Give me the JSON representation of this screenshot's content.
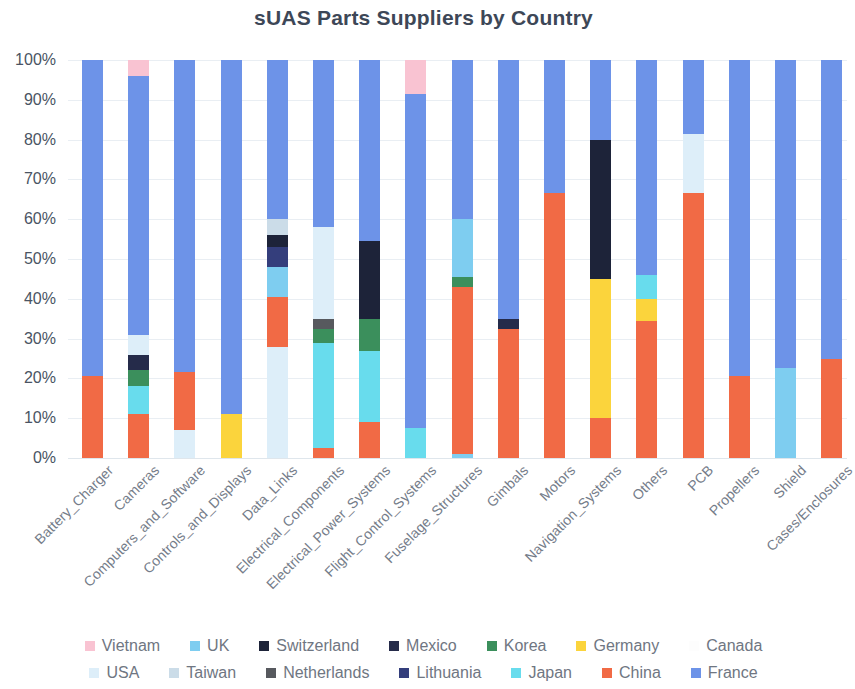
{
  "chart_data": {
    "type": "bar",
    "subtype": "stacked-100-percent",
    "title": "sUAS Parts Suppliers by Country",
    "xlabel": "",
    "ylabel": "",
    "ylim": [
      0,
      100
    ],
    "ytick_labels": [
      "0%",
      "10%",
      "20%",
      "30%",
      "40%",
      "50%",
      "60%",
      "70%",
      "80%",
      "90%",
      "100%"
    ],
    "ytick_values": [
      0,
      10,
      20,
      30,
      40,
      50,
      60,
      70,
      80,
      90,
      100
    ],
    "grid": true,
    "legend_position": "bottom",
    "categories": [
      "Battery_Charger",
      "Cameras",
      "Computers_and_Software",
      "Controls_and_Displays",
      "Data_Links",
      "Electrical_Components",
      "Electrical_Power_Systems",
      "Flight_Control_Systems",
      "Fuselage_Structures",
      "Gimbals",
      "Motors",
      "Navigation_Systems",
      "Others",
      "PCB",
      "Propellers",
      "Shield",
      "Cases/Enclosures"
    ],
    "series": [
      {
        "name": "Vietnam",
        "color": "#f9c3d2",
        "values": [
          0,
          4,
          0,
          0,
          0,
          0,
          0,
          8.5,
          0,
          0,
          0,
          0,
          0,
          0,
          0,
          0,
          0
        ]
      },
      {
        "name": "UK",
        "color": "#7ecdf0",
        "values": [
          0,
          0,
          0,
          0,
          7.5,
          0,
          0,
          0,
          15.5,
          0,
          0,
          0,
          0,
          0,
          0,
          22.5,
          0
        ]
      },
      {
        "name": "Switzerland",
        "color": "#1d2339",
        "values": [
          0,
          0,
          0,
          0,
          3,
          0,
          19.5,
          0,
          0,
          0,
          0,
          35,
          0,
          0,
          0,
          0,
          0
        ]
      },
      {
        "name": "Mexico",
        "color": "#252b4a",
        "values": [
          0,
          4,
          0,
          0,
          0,
          0,
          0,
          0,
          0,
          2.5,
          0,
          0,
          0,
          0,
          0,
          0,
          0
        ]
      },
      {
        "name": "Korea",
        "color": "#3b8f5c",
        "values": [
          0,
          4,
          0,
          0,
          0,
          3.5,
          8,
          0,
          2.5,
          0,
          0,
          0,
          0,
          0,
          0,
          0,
          0
        ]
      },
      {
        "name": "Germany",
        "color": "#fbd43c",
        "values": [
          0,
          0,
          0,
          11,
          0,
          0,
          0,
          0,
          0,
          0,
          0,
          35,
          5.5,
          0,
          0,
          0,
          0
        ]
      },
      {
        "name": "Canada",
        "color": "#fdfdfd",
        "values": [
          0,
          0,
          0,
          0,
          0,
          0,
          0,
          0,
          0,
          0,
          0,
          0,
          0,
          0,
          0,
          0,
          0
        ]
      },
      {
        "name": "USA",
        "color": "#ddeef9",
        "values": [
          0,
          5,
          7,
          0,
          28,
          23,
          0,
          0,
          0,
          0,
          0,
          0,
          0,
          15,
          0,
          0,
          0
        ]
      },
      {
        "name": "Taiwan",
        "color": "#cbdce8",
        "values": [
          0,
          0,
          0,
          0,
          4,
          0,
          0,
          0,
          0,
          0,
          0,
          0,
          0,
          0,
          0,
          0,
          0
        ]
      },
      {
        "name": "Netherlands",
        "color": "#57595e",
        "values": [
          0,
          0,
          0,
          0,
          0,
          2.5,
          0,
          0,
          0,
          0,
          0,
          0,
          0,
          0,
          0,
          0,
          0
        ]
      },
      {
        "name": "Lithuania",
        "color": "#343e7c",
        "values": [
          0,
          0,
          0,
          0,
          5,
          0,
          0,
          0,
          0,
          0,
          0,
          0,
          0,
          0,
          0,
          0,
          0
        ]
      },
      {
        "name": "Japan",
        "color": "#68dced",
        "values": [
          0,
          7,
          0,
          0,
          0,
          26.5,
          18,
          7.5,
          0,
          0,
          0,
          0,
          6,
          0,
          0,
          0,
          0
        ]
      },
      {
        "name": "China",
        "color": "#f16a45",
        "values": [
          20.5,
          11,
          14.5,
          0,
          12.5,
          2.5,
          9,
          0,
          42,
          32.5,
          66.5,
          10,
          34.5,
          66.5,
          20.5,
          0,
          25
        ]
      },
      {
        "name": "France",
        "color": "#6d93e8",
        "values": [
          79.5,
          65,
          78.5,
          89,
          40,
          42,
          45.5,
          84,
          40,
          65,
          33.5,
          20,
          54,
          18.5,
          79.5,
          77.5,
          75
        ]
      }
    ],
    "stack_order_bottom_to_top": [
      "China",
      "Japan",
      "Korea",
      "Netherlands",
      "Lithuania",
      "Switzerland",
      "Mexico",
      "Germany",
      "Taiwan",
      "USA",
      "UK",
      "Canada",
      "France",
      "Vietnam"
    ],
    "bar_stacks": [
      {
        "category": "Battery_Charger",
        "segments": [
          {
            "name": "China",
            "from": 0,
            "to": 20.5
          },
          {
            "name": "France",
            "from": 20.5,
            "to": 100
          }
        ]
      },
      {
        "category": "Cameras",
        "segments": [
          {
            "name": "China",
            "from": 0,
            "to": 11
          },
          {
            "name": "Japan",
            "from": 11,
            "to": 18
          },
          {
            "name": "Korea",
            "from": 18,
            "to": 22
          },
          {
            "name": "Mexico",
            "from": 22,
            "to": 26
          },
          {
            "name": "USA",
            "from": 26,
            "to": 31
          },
          {
            "name": "France",
            "from": 31,
            "to": 96
          },
          {
            "name": "Vietnam",
            "from": 96,
            "to": 100
          }
        ]
      },
      {
        "category": "Computers_and_Software",
        "segments": [
          {
            "name": "USA",
            "from": 0,
            "to": 7
          },
          {
            "name": "China",
            "from": 7,
            "to": 21.5
          },
          {
            "name": "France",
            "from": 21.5,
            "to": 100
          }
        ]
      },
      {
        "category": "Controls_and_Displays",
        "segments": [
          {
            "name": "Germany",
            "from": 0,
            "to": 11
          },
          {
            "name": "France",
            "from": 11,
            "to": 100
          }
        ]
      },
      {
        "category": "Data_Links",
        "segments": [
          {
            "name": "USA",
            "from": 0,
            "to": 28
          },
          {
            "name": "China",
            "from": 28,
            "to": 40.5
          },
          {
            "name": "UK",
            "from": 40.5,
            "to": 48
          },
          {
            "name": "Lithuania",
            "from": 48,
            "to": 53
          },
          {
            "name": "Switzerland",
            "from": 53,
            "to": 56
          },
          {
            "name": "Taiwan",
            "from": 56,
            "to": 60
          },
          {
            "name": "France",
            "from": 60,
            "to": 100
          }
        ]
      },
      {
        "category": "Electrical_Components",
        "segments": [
          {
            "name": "China",
            "from": 0,
            "to": 2.5
          },
          {
            "name": "Japan",
            "from": 2.5,
            "to": 29
          },
          {
            "name": "Korea",
            "from": 29,
            "to": 32.5
          },
          {
            "name": "Netherlands",
            "from": 32.5,
            "to": 35
          },
          {
            "name": "USA",
            "from": 35,
            "to": 58
          },
          {
            "name": "France",
            "from": 58,
            "to": 100
          }
        ]
      },
      {
        "category": "Electrical_Power_Systems",
        "segments": [
          {
            "name": "China",
            "from": 0,
            "to": 9
          },
          {
            "name": "Japan",
            "from": 9,
            "to": 27
          },
          {
            "name": "Korea",
            "from": 27,
            "to": 35
          },
          {
            "name": "Switzerland",
            "from": 35,
            "to": 54.5
          },
          {
            "name": "France",
            "from": 54.5,
            "to": 100
          }
        ]
      },
      {
        "category": "Flight_Control_Systems",
        "segments": [
          {
            "name": "Japan",
            "from": 0,
            "to": 7.5
          },
          {
            "name": "France",
            "from": 7.5,
            "to": 91.5
          },
          {
            "name": "Vietnam",
            "from": 91.5,
            "to": 100
          }
        ]
      },
      {
        "category": "Fuselage_Structures",
        "segments": [
          {
            "name": "UK",
            "from": 0,
            "to": 1
          },
          {
            "name": "China",
            "from": 1,
            "to": 43
          },
          {
            "name": "Korea",
            "from": 43,
            "to": 45.5
          },
          {
            "name": "UK",
            "from": 45.5,
            "to": 60
          },
          {
            "name": "France",
            "from": 60,
            "to": 100
          }
        ]
      },
      {
        "category": "Gimbals",
        "segments": [
          {
            "name": "China",
            "from": 0,
            "to": 32.5
          },
          {
            "name": "Mexico",
            "from": 32.5,
            "to": 35
          },
          {
            "name": "France",
            "from": 35,
            "to": 100
          }
        ]
      },
      {
        "category": "Motors",
        "segments": [
          {
            "name": "China",
            "from": 0,
            "to": 66.5
          },
          {
            "name": "France",
            "from": 66.5,
            "to": 100
          }
        ]
      },
      {
        "category": "Navigation_Systems",
        "segments": [
          {
            "name": "China",
            "from": 0,
            "to": 10
          },
          {
            "name": "Germany",
            "from": 10,
            "to": 45
          },
          {
            "name": "Switzerland",
            "from": 45,
            "to": 80
          },
          {
            "name": "France",
            "from": 80,
            "to": 100
          }
        ]
      },
      {
        "category": "Others",
        "segments": [
          {
            "name": "China",
            "from": 0,
            "to": 34.5
          },
          {
            "name": "Germany",
            "from": 34.5,
            "to": 40
          },
          {
            "name": "Japan",
            "from": 40,
            "to": 46
          },
          {
            "name": "France",
            "from": 46,
            "to": 100
          }
        ]
      },
      {
        "category": "PCB",
        "segments": [
          {
            "name": "China",
            "from": 0,
            "to": 66.5
          },
          {
            "name": "USA",
            "from": 66.5,
            "to": 81.5
          },
          {
            "name": "France",
            "from": 81.5,
            "to": 100
          }
        ]
      },
      {
        "category": "Propellers",
        "segments": [
          {
            "name": "China",
            "from": 0,
            "to": 20.5
          },
          {
            "name": "France",
            "from": 20.5,
            "to": 100
          }
        ]
      },
      {
        "category": "Shield",
        "segments": [
          {
            "name": "UK",
            "from": 0,
            "to": 22.5
          },
          {
            "name": "France",
            "from": 22.5,
            "to": 100
          }
        ]
      },
      {
        "category": "Cases/Enclosures",
        "segments": [
          {
            "name": "China",
            "from": 0,
            "to": 25
          },
          {
            "name": "France",
            "from": 25,
            "to": 100
          }
        ]
      }
    ],
    "legend_rows": [
      [
        {
          "label": "Vietnam",
          "color": "#f9c3d2"
        },
        {
          "label": "UK",
          "color": "#7ecdf0"
        },
        {
          "label": "Switzerland",
          "color": "#1d2339"
        },
        {
          "label": "Mexico",
          "color": "#252b4a"
        },
        {
          "label": "Korea",
          "color": "#3b8f5c"
        },
        {
          "label": "Germany",
          "color": "#fbd43c"
        },
        {
          "label": "Canada",
          "color": "#fdfdfd"
        }
      ],
      [
        {
          "label": "USA",
          "color": "#ddeef9"
        },
        {
          "label": "Taiwan",
          "color": "#cbdce8"
        },
        {
          "label": "Netherlands",
          "color": "#57595e"
        },
        {
          "label": "Lithuania",
          "color": "#343e7c"
        },
        {
          "label": "Japan",
          "color": "#68dced"
        },
        {
          "label": "China",
          "color": "#f16a45"
        },
        {
          "label": "France",
          "color": "#6d93e8"
        }
      ]
    ],
    "colors": {
      "title": "#3d4757",
      "axis_text": "#4a5463",
      "category_text": "#747c89",
      "legend_text": "#6f7682",
      "gridline": "#e9eef3",
      "background": "#ffffff"
    }
  }
}
